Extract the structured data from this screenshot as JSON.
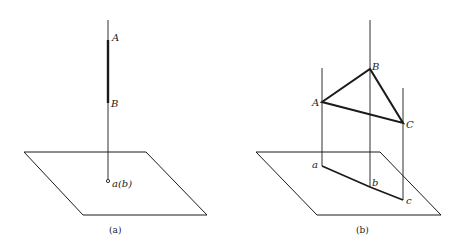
{
  "panels": [
    {
      "caption": "(a)",
      "labels": {
        "A": "A",
        "B": "B",
        "proj": "a(b)"
      }
    },
    {
      "caption": "(b)",
      "labels": {
        "A": "A",
        "B": "B",
        "C": "C",
        "a": "a",
        "b": "b",
        "c": "c"
      }
    }
  ],
  "colors": {
    "stroke": "#1a1a1a",
    "background": "#ffffff"
  }
}
